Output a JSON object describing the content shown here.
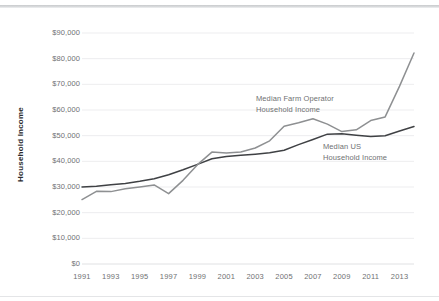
{
  "chart_data": {
    "type": "line",
    "title": "",
    "xlabel": "",
    "ylabel": "Household Income",
    "xlim": [
      1991,
      2014
    ],
    "ylim": [
      0,
      90000
    ],
    "grid": true,
    "legend_position": "inline-annotations",
    "x": [
      1991,
      1992,
      1993,
      1994,
      1995,
      1996,
      1997,
      1998,
      1999,
      2000,
      2001,
      2002,
      2003,
      2004,
      2005,
      2006,
      2007,
      2008,
      2009,
      2010,
      2011,
      2012,
      2013,
      2014
    ],
    "xticks": [
      "1991",
      "1993",
      "1995",
      "1997",
      "1999",
      "2001",
      "2003",
      "2005",
      "2007",
      "2009",
      "2011",
      "2013"
    ],
    "yticks": [
      "$0",
      "$10,000",
      "$20,000",
      "$30,000",
      "$40,000",
      "$50,000",
      "$60,000",
      "$70,000",
      "$80,000",
      "$90,000"
    ],
    "ytick_values": [
      0,
      10000,
      20000,
      30000,
      40000,
      50000,
      60000,
      70000,
      80000,
      90000
    ],
    "series": [
      {
        "name": "Median US Household Income",
        "color": "#3f4144",
        "annotation": [
          "Median US",
          "Household Income"
        ],
        "values": [
          30000,
          30300,
          30900,
          31400,
          32200,
          33200,
          34800,
          36700,
          38800,
          41000,
          41900,
          42400,
          42800,
          43300,
          44300,
          46500,
          48500,
          50600,
          50700,
          50200,
          49700,
          50000,
          51800,
          53600
        ]
      },
      {
        "name": "Median Farm Operator Household Income",
        "color": "#8e9092",
        "annotation": [
          "Median Farm Operator",
          "Household Income"
        ],
        "values": [
          25100,
          28300,
          28200,
          29300,
          30000,
          30800,
          27400,
          32600,
          38700,
          43600,
          43200,
          43600,
          45200,
          48000,
          53700,
          55000,
          56600,
          54500,
          51600,
          52300,
          55900,
          57300,
          69300,
          82200
        ]
      }
    ]
  }
}
